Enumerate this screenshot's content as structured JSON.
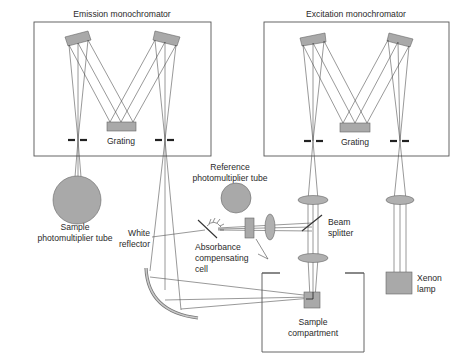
{
  "diagram": {
    "colors": {
      "component_fill": "#a9a9a9",
      "outline": "#555555",
      "ray": "#444444",
      "text": "#2a2a2a",
      "background": "#ffffff"
    },
    "labels": {
      "emission_monochromator": "Emission monochromator",
      "excitation_monochromator": "Excitation monochromator",
      "emission_grating": "Grating",
      "excitation_grating": "Grating",
      "reference_pmt_line1": "Reference",
      "reference_pmt_line2": "photomultiplier tube",
      "sample_pmt_line1": "Sample",
      "sample_pmt_line2": "photomultiplier tube",
      "white_reflector_line1": "White",
      "white_reflector_line2": "reflector",
      "absorbance_cell_line1": "Absorbance",
      "absorbance_cell_line2": "compensating",
      "absorbance_cell_line3": "cell",
      "beam_splitter_line1": "Beam",
      "beam_splitter_line2": "splitter",
      "xenon_lamp_line1": "Xenon",
      "xenon_lamp_line2": "lamp",
      "sample_compartment_line1": "Sample",
      "sample_compartment_line2": "compartment"
    },
    "components": [
      {
        "id": "emission-monochromator",
        "type": "box",
        "x": 34,
        "y": 22,
        "w": 177,
        "h": 134
      },
      {
        "id": "excitation-monochromator",
        "type": "box",
        "x": 264,
        "y": 22,
        "w": 185,
        "h": 134
      },
      {
        "id": "emission-grating",
        "type": "grating"
      },
      {
        "id": "excitation-grating",
        "type": "grating"
      },
      {
        "id": "sample-photomultiplier-tube",
        "type": "circle",
        "cx": 77,
        "cy": 200,
        "r": 24
      },
      {
        "id": "reference-photomultiplier-tube",
        "type": "circle",
        "cx": 236,
        "cy": 198,
        "r": 15
      },
      {
        "id": "absorbance-compensating-cell",
        "type": "rect"
      },
      {
        "id": "beam-splitter",
        "type": "mirror"
      },
      {
        "id": "white-reflector",
        "type": "curved-mirror"
      },
      {
        "id": "sample-compartment",
        "type": "box",
        "x": 262,
        "y": 272,
        "w": 102,
        "h": 80
      },
      {
        "id": "xenon-lamp",
        "type": "rect",
        "x": 386,
        "y": 272,
        "w": 26,
        "h": 22
      }
    ]
  }
}
